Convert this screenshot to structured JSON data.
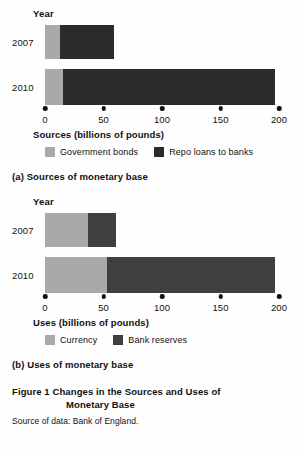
{
  "figure": {
    "title_line1": "Figure 1  Changes in the Sources and Uses of",
    "title_line2": "Monetary Base",
    "source_note": "Source of data: Bank of England."
  },
  "colors": {
    "light_gray": "#a9a9a9",
    "dark_sources": "#2b2b2b",
    "dark_uses": "#3f3f3f",
    "text": "#111111"
  },
  "panel_a": {
    "caption": "(a) Sources of monetary base",
    "year_axis_label": "Year",
    "value_axis_label": "Sources (billions of pounds)",
    "legend": [
      {
        "label": "Government bonds",
        "color": "#a9a9a9"
      },
      {
        "label": "Repo loans to banks",
        "color": "#2b2b2b"
      }
    ],
    "ticks": [
      "0",
      "50",
      "100",
      "150",
      "200"
    ],
    "categories": [
      "2007",
      "2010"
    ]
  },
  "panel_b": {
    "caption": "(b) Uses of monetary base",
    "year_axis_label": "Year",
    "value_axis_label": "Uses (billions of pounds)",
    "legend": [
      {
        "label": "Currency",
        "color": "#a9a9a9"
      },
      {
        "label": "Bank reserves",
        "color": "#3f3f3f"
      }
    ],
    "ticks": [
      "0",
      "50",
      "100",
      "150",
      "200"
    ],
    "categories": [
      "2007",
      "2010"
    ]
  },
  "chart_data": [
    {
      "type": "bar",
      "orientation": "horizontal",
      "stacked": true,
      "title": "(a) Sources of monetary base",
      "xlabel": "Sources (billions of pounds)",
      "ylabel": "Year",
      "xlim": [
        0,
        200
      ],
      "xticks": [
        0,
        50,
        100,
        150,
        200
      ],
      "grid": false,
      "legend_position": "bottom",
      "categories": [
        "2007",
        "2010"
      ],
      "series": [
        {
          "name": "Government bonds",
          "color": "#a9a9a9",
          "values": [
            13,
            15
          ]
        },
        {
          "name": "Repo loans to banks",
          "color": "#2b2b2b",
          "values": [
            46,
            182
          ]
        }
      ],
      "totals": [
        59,
        197
      ]
    },
    {
      "type": "bar",
      "orientation": "horizontal",
      "stacked": true,
      "title": "(b) Uses of monetary base",
      "xlabel": "Uses (billions of pounds)",
      "ylabel": "Year",
      "xlim": [
        0,
        200
      ],
      "xticks": [
        0,
        50,
        100,
        150,
        200
      ],
      "grid": false,
      "legend_position": "bottom",
      "categories": [
        "2007",
        "2010"
      ],
      "series": [
        {
          "name": "Currency",
          "color": "#a9a9a9",
          "values": [
            37,
            53
          ]
        },
        {
          "name": "Bank reserves",
          "color": "#3f3f3f",
          "values": [
            24,
            144
          ]
        }
      ],
      "totals": [
        61,
        197
      ]
    }
  ]
}
